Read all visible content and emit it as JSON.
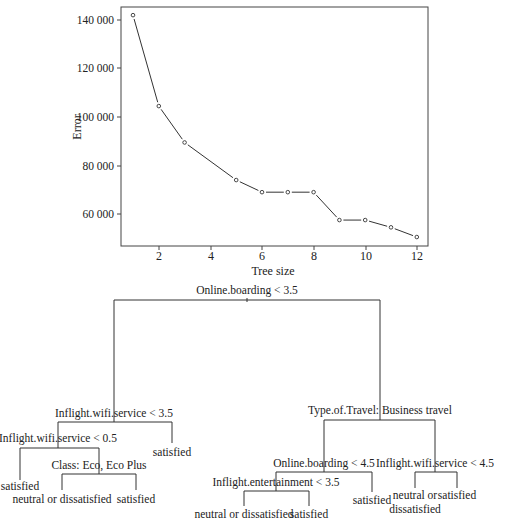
{
  "chart_data": [
    {
      "type": "line",
      "title": "",
      "xlabel": "Tree size",
      "ylabel": "Error",
      "x": [
        1,
        2,
        3,
        5,
        6,
        7,
        8,
        9,
        10,
        11,
        12
      ],
      "values": [
        142000,
        104500,
        89500,
        74000,
        69000,
        69000,
        69000,
        57500,
        57500,
        54500,
        50500
      ],
      "xticks": [
        "2",
        "4",
        "6",
        "8",
        "10",
        "12"
      ],
      "yticks": [
        "60 000",
        "80 000",
        "100 000",
        "120 000",
        "140 000"
      ],
      "xlim": [
        0.5,
        12.4
      ],
      "ylim": [
        46500,
        145500
      ],
      "grid": false,
      "marker": "open-circle"
    },
    {
      "type": "tree",
      "root": {
        "split": "Online.boarding < 3.5",
        "left": {
          "split": "Inflight.wifi.service < 3.5",
          "left": {
            "split": "Inflight.wifi.service < 0.5",
            "left": {
              "leaf": "satisfied"
            },
            "right": {
              "split": "Class: Eco, Eco Plus",
              "left": {
                "leaf": "neutral or dissatisfied"
              },
              "right": {
                "leaf": "satisfied"
              }
            }
          },
          "right": {
            "leaf": "satisfied"
          }
        },
        "right": {
          "split": "Type.of.Travel: Business travel",
          "left": {
            "split": "Online.boarding < 4.5",
            "left": {
              "split": "Inflight.entertainment < 3.5",
              "left": {
                "leaf": "neutral or dissatisfied"
              },
              "right": {
                "leaf": "satisfied"
              }
            },
            "right": {
              "leaf": "satisfied"
            }
          },
          "right": {
            "split": "Inflight.wifi.service < 4.5",
            "left": {
              "leaf": "neutral or dissatisfied"
            },
            "right": {
              "leaf": "satisfied"
            }
          }
        }
      }
    }
  ],
  "plot": {
    "xlabel": "Tree size",
    "ylabel": "Error",
    "xticks": [
      "2",
      "4",
      "6",
      "8",
      "10",
      "12"
    ],
    "yticks": [
      "60 000",
      "80 000",
      "100 000",
      "120 000",
      "140 000"
    ]
  },
  "tree": {
    "n0": "Online.boarding < 3.5",
    "n1": "Inflight.wifi.service < 3.5",
    "n2": "Inflight.wifi.service < 0.5",
    "n3": "Class: Eco, Eco Plus",
    "n4": "Type.of.Travel: Business travel",
    "n5": "Online.boarding < 4.5",
    "n6": "Inflight.entertainment < 3.5",
    "n7": "Inflight.wifi.service < 4.5",
    "leaf_a": "satisfied",
    "leaf_b": "neutral or dissatisfied",
    "leaf_c": "satisfied",
    "leaf_d": "satisfied",
    "leaf_e": "neutral or dissatisfied",
    "leaf_f": "satisfied",
    "leaf_g": "satisfied",
    "leaf_h1": "neutral or",
    "leaf_h2": "dissatisfied",
    "leaf_i": "satisfied"
  }
}
